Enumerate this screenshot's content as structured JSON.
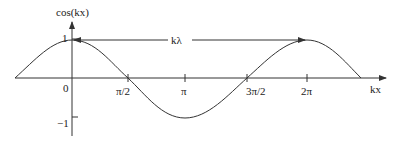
{
  "diagram": {
    "y_axis_label": "cos(kx)",
    "x_axis_label": "kx",
    "span_label": "kλ",
    "y_ticks": [
      "1",
      "−1"
    ],
    "x_ticks": [
      "0",
      "π/2",
      "π",
      "3π/2",
      "2π"
    ],
    "line_color": "#333333"
  }
}
